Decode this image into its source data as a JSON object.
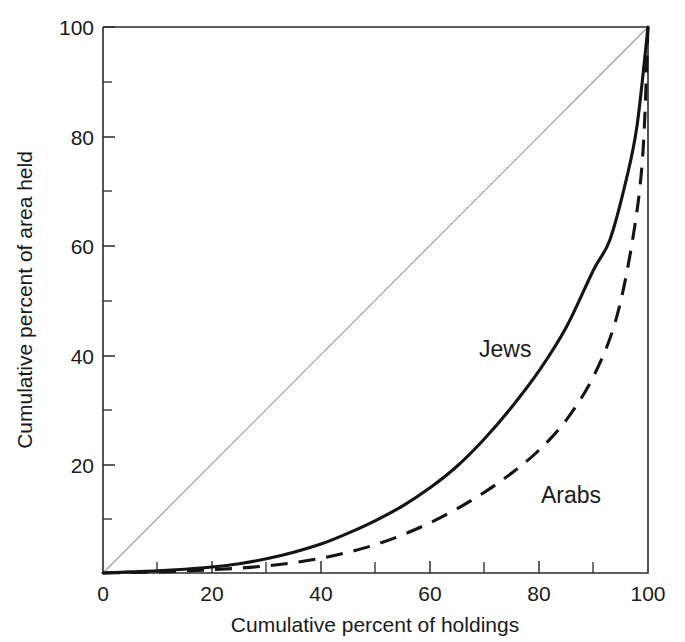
{
  "chart_data": {
    "type": "line",
    "title": "",
    "subtitle": "",
    "xlabel": "Cumulative percent of holdings",
    "ylabel": "Cumulative percent of area held",
    "xlim": [
      0,
      100
    ],
    "ylim": [
      0,
      100
    ],
    "xticks": [
      0,
      20,
      40,
      60,
      80,
      100
    ],
    "yticks": [
      0,
      20,
      40,
      60,
      80,
      100
    ],
    "xtick_labels": [
      "0",
      "20",
      "40",
      "60",
      "80",
      "100"
    ],
    "ytick_labels": [
      "0",
      "20",
      "40",
      "60",
      "80",
      "100"
    ],
    "xminor_ticks": [
      10,
      30,
      50,
      70,
      90
    ],
    "yminor_ticks": [
      10,
      30,
      50,
      70,
      90
    ],
    "grid": false,
    "legend_position": "inline-annotation",
    "annotations": [
      {
        "text": "Jews",
        "x": 73,
        "y": 44
      },
      {
        "text": "Arabs",
        "x": 86,
        "y": 17
      }
    ],
    "reference_line": {
      "name": "line of equality",
      "x": [
        0,
        100
      ],
      "y": [
        0,
        100
      ],
      "style": "thin-solid-gray"
    },
    "series": [
      {
        "name": "Jews",
        "style": "solid",
        "x": [
          0,
          5,
          10,
          15,
          20,
          25,
          30,
          35,
          40,
          45,
          50,
          55,
          60,
          65,
          70,
          75,
          80,
          85,
          90,
          93,
          96,
          98,
          100
        ],
        "values": [
          0,
          0.2,
          0.4,
          0.7,
          1.1,
          1.7,
          2.6,
          3.8,
          5.3,
          7.3,
          9.6,
          12.3,
          15.6,
          19.6,
          24.6,
          30.4,
          37.0,
          45.0,
          55.5,
          61.0,
          72.0,
          82.0,
          100
        ]
      },
      {
        "name": "Arabs",
        "style": "dashed",
        "x": [
          0,
          5,
          10,
          15,
          20,
          25,
          30,
          35,
          40,
          45,
          50,
          55,
          60,
          65,
          70,
          75,
          80,
          85,
          90,
          94,
          97,
          99,
          100
        ],
        "values": [
          0,
          0.1,
          0.2,
          0.4,
          0.6,
          0.9,
          1.3,
          1.9,
          2.7,
          3.8,
          5.2,
          7.0,
          9.2,
          11.8,
          14.8,
          18.3,
          22.5,
          28.0,
          36.0,
          46.0,
          60.0,
          76.0,
          100
        ]
      }
    ]
  }
}
